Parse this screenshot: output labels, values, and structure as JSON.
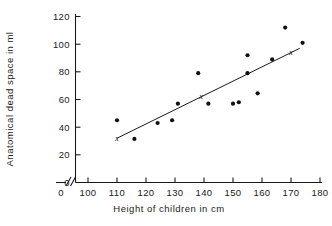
{
  "chart_data": {
    "type": "scatter",
    "title": "",
    "xlabel": "Height of children in cm",
    "ylabel": "Anatomical dead space in ml",
    "xlim": [
      100,
      180
    ],
    "ylim": [
      0,
      120
    ],
    "x_ticks": [
      0,
      100,
      110,
      120,
      130,
      140,
      150,
      160,
      170,
      180
    ],
    "y_ticks": [
      0,
      20,
      40,
      60,
      80,
      100,
      120
    ],
    "x_axis_break": true,
    "grid": false,
    "legend": "none",
    "points": [
      {
        "x": 110,
        "y": 45
      },
      {
        "x": 116,
        "y": 31.5
      },
      {
        "x": 124,
        "y": 43
      },
      {
        "x": 129,
        "y": 45
      },
      {
        "x": 131,
        "y": 57
      },
      {
        "x": 138,
        "y": 79
      },
      {
        "x": 141.5,
        "y": 57
      },
      {
        "x": 150,
        "y": 57
      },
      {
        "x": 152,
        "y": 58
      },
      {
        "x": 155,
        "y": 92
      },
      {
        "x": 155,
        "y": 79
      },
      {
        "x": 158.5,
        "y": 64.5
      },
      {
        "x": 163.5,
        "y": 89
      },
      {
        "x": 168,
        "y": 112
      },
      {
        "x": 174,
        "y": 101
      }
    ],
    "regression_line": {
      "label": "fitted line",
      "x_start": 110,
      "y_start": 32,
      "x_end": 173,
      "y_end": 97
    },
    "x_markers": [
      {
        "x": 110,
        "y": 32,
        "symbol": "x"
      },
      {
        "x": 139,
        "y": 62.5,
        "symbol": "x"
      },
      {
        "x": 170,
        "y": 94,
        "symbol": "x"
      }
    ]
  },
  "labels": {
    "y_axis_title": "Anatomical dead space in ml",
    "x_axis_title": "Height of children in cm",
    "y_tick_texts": [
      "0",
      "20",
      "40",
      "60",
      "80",
      "100",
      "120"
    ],
    "x_tick_texts": [
      "0",
      "100",
      "110",
      "120",
      "130",
      "140",
      "150",
      "160",
      "170",
      "180"
    ]
  },
  "colors": {
    "ink": "#1a1a1a",
    "point": "#111111",
    "background": "#ffffff"
  }
}
